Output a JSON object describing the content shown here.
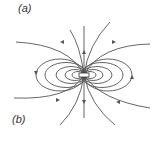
{
  "diagram": {
    "type": "magnetic-dipole-field-lines",
    "labels": {
      "a": "(a)",
      "b": "(b)"
    },
    "line_color": "#555555"
  }
}
